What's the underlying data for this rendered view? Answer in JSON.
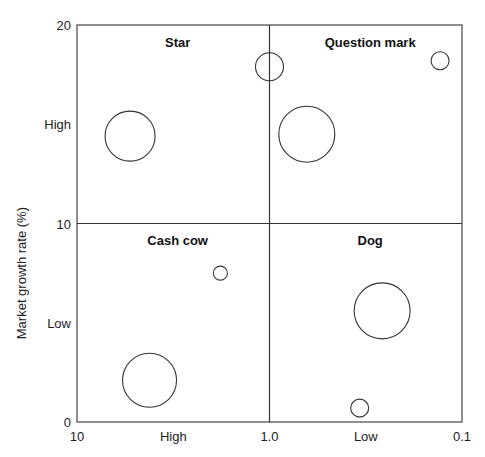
{
  "chart_data": {
    "type": "scatter",
    "subtype": "bubble-matrix",
    "title": "",
    "xlabel": "",
    "ylabel": "Market growth rate (%)",
    "x_scale": "log",
    "x_reversed": true,
    "xlim": [
      10,
      0.1
    ],
    "ylim": [
      0,
      20
    ],
    "x_ticks": [
      {
        "value": 10,
        "label": "10"
      },
      {
        "value": 3.16,
        "label": "High"
      },
      {
        "value": 1.0,
        "label": "1.0"
      },
      {
        "value": 0.316,
        "label": "Low"
      },
      {
        "value": 0.1,
        "label": "0.1"
      }
    ],
    "y_ticks": [
      {
        "value": 20,
        "label": "20"
      },
      {
        "value": 15,
        "label": "High"
      },
      {
        "value": 10,
        "label": "10"
      },
      {
        "value": 5,
        "label": "Low"
      },
      {
        "value": 0,
        "label": "0"
      }
    ],
    "dividers": {
      "x": 1.0,
      "y": 10
    },
    "grid": false,
    "legend": "none",
    "quadrants": [
      {
        "name": "Star",
        "x": 3.0,
        "y": 18.9
      },
      {
        "name": "Question mark",
        "x": 0.3,
        "y": 18.9
      },
      {
        "name": "Cash cow",
        "x": 3.0,
        "y": 8.9
      },
      {
        "name": "Dog",
        "x": 0.3,
        "y": 8.9
      }
    ],
    "points": [
      {
        "quadrant": "Star",
        "x": 5.3,
        "y": 14.4,
        "size": 25
      },
      {
        "quadrant": "Star/Question mark",
        "x": 1.0,
        "y": 17.9,
        "size": 14
      },
      {
        "quadrant": "Question mark",
        "x": 0.64,
        "y": 14.5,
        "size": 28
      },
      {
        "quadrant": "Question mark",
        "x": 0.13,
        "y": 18.2,
        "size": 9
      },
      {
        "quadrant": "Cash cow",
        "x": 1.8,
        "y": 7.5,
        "size": 7
      },
      {
        "quadrant": "Cash cow",
        "x": 4.2,
        "y": 2.1,
        "size": 27
      },
      {
        "quadrant": "Dog",
        "x": 0.26,
        "y": 5.6,
        "size": 28
      },
      {
        "quadrant": "Dog",
        "x": 0.34,
        "y": 0.7,
        "size": 9
      }
    ]
  }
}
